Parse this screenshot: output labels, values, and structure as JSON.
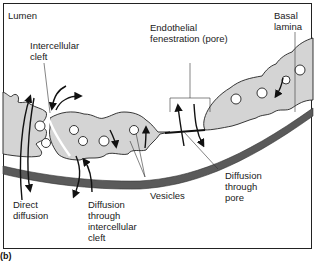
{
  "diagram": {
    "panel_label": "(b)",
    "colors": {
      "cell_fill": "#d4d4d4",
      "outline": "#222222",
      "basal_lamina": "#5a5a5a",
      "background": "#ffffff"
    },
    "labels": {
      "lumen": "Lumen",
      "intercellular_cleft": "Intercellular\ncleft",
      "endothelial_fenestration": "Endothelial\nfenestration (pore)",
      "basal_lamina": "Basal\nlamina",
      "direct_diffusion": "Direct\ndiffusion",
      "diffusion_through_cleft": "Diffusion\nthrough\nintercellular\ncleft",
      "vesicles": "Vesicles",
      "diffusion_through_pore": "Diffusion\nthrough\npore"
    }
  }
}
